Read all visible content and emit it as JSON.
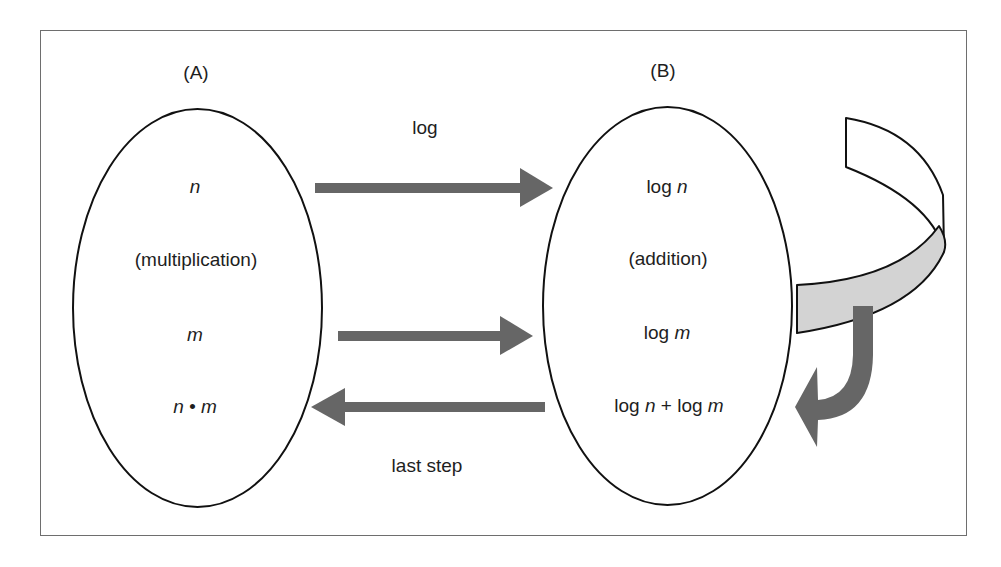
{
  "panel_a": {
    "title": "(A)",
    "items": [
      {
        "text": "n",
        "italic": true
      },
      {
        "text": "(multiplication)",
        "italic": false
      },
      {
        "text": "m",
        "italic": true
      },
      {
        "text": "n • m",
        "italic": true
      }
    ]
  },
  "panel_b": {
    "title": "(B)",
    "items": [
      {
        "prefix": "log ",
        "var": "n"
      },
      {
        "text": "(addition)"
      },
      {
        "prefix": "log ",
        "var": "m"
      },
      {
        "prefix": "log ",
        "var": "n",
        "mid": " + log ",
        "var2": "m"
      }
    ]
  },
  "arrows": {
    "top_label": "log",
    "bottom_label": "last step"
  },
  "colors": {
    "arrow": "#666666",
    "ribbon_front": "#d3d3d3",
    "ribbon_back": "#ffffff",
    "outline": "#111111",
    "frame": "#6e6e6e"
  }
}
